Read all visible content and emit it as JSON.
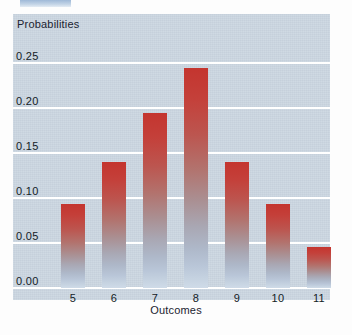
{
  "chart_data": {
    "type": "bar",
    "title": "",
    "xlabel": "Outcomes",
    "ylabel": "Probabilities",
    "categories": [
      "5",
      "6",
      "7",
      "8",
      "9",
      "10",
      "11"
    ],
    "values": [
      0.093,
      0.14,
      0.195,
      0.245,
      0.14,
      0.093,
      0.046
    ],
    "ylim": [
      0.0,
      0.27
    ],
    "yticks": [
      0.0,
      0.05,
      0.1,
      0.15,
      0.2,
      0.25
    ],
    "ytick_labels": [
      "0.00",
      "0.05",
      "0.10",
      "0.15",
      "0.20",
      "0.25"
    ],
    "grid": true,
    "legend": "none",
    "bar_color_top": "#c4352f",
    "bar_color_bottom": "#cfdbe8",
    "plot_background": "#ccd7e2",
    "gridline_color": "#ffffff"
  },
  "decor": {
    "top_fragment_color": "#9fb9d8"
  }
}
